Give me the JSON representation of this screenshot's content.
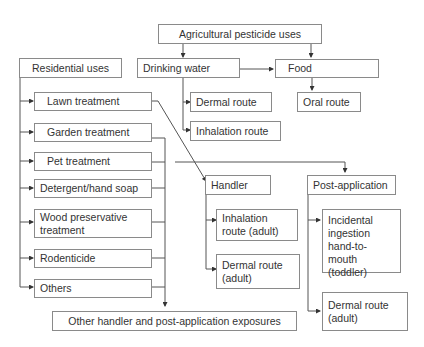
{
  "diagram": {
    "title": "Agricultural pesticide uses",
    "agricultural": {
      "root": "Agricultural pesticide uses",
      "drinking_water": "Drinking water",
      "food": "Food",
      "dermal_route": "Dermal route",
      "inhalation_route": "Inhalation route",
      "oral_route": "Oral route"
    },
    "residential": {
      "root": "Residential uses",
      "items": [
        "Lawn treatment",
        "Garden treatment",
        "Pet treatment",
        "Detergent/hand soap",
        "Wood preservative treatment",
        "Rodenticide",
        "Others"
      ]
    },
    "handler": {
      "label": "Handler",
      "inhalation": "Inhalation route (adult)",
      "dermal": "Dermal route (adult)"
    },
    "post_application": {
      "label": "Post-application",
      "ingestion": "Incidental ingestion hand-to-mouth (toddler)",
      "dermal": "Dermal route (adult)"
    },
    "other_exposures": "Other handler and post-application exposures",
    "line_color": "#555555",
    "box_border_color": "#8a8a8a"
  }
}
